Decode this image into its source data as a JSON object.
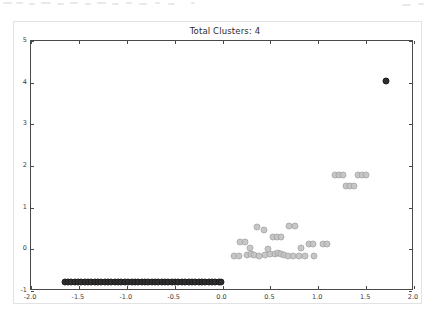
{
  "figure": {
    "title": "Total Clusters: 4",
    "background_color": "#ffffff",
    "frame_color": "#e2e2e4",
    "axes_color": "#4a4a4a"
  },
  "speckles": [
    {
      "x": 3,
      "y": 2,
      "w": 9
    },
    {
      "x": 16,
      "y": 2,
      "w": 7
    },
    {
      "x": 29,
      "y": 3,
      "w": 6
    },
    {
      "x": 41,
      "y": 2,
      "w": 10
    },
    {
      "x": 57,
      "y": 3,
      "w": 7
    },
    {
      "x": 70,
      "y": 2,
      "w": 8
    },
    {
      "x": 85,
      "y": 3,
      "w": 6
    },
    {
      "x": 97,
      "y": 2,
      "w": 9
    },
    {
      "x": 112,
      "y": 3,
      "w": 7
    },
    {
      "x": 126,
      "y": 2,
      "w": 6
    },
    {
      "x": 139,
      "y": 3,
      "w": 8
    },
    {
      "x": 155,
      "y": 2,
      "w": 5
    },
    {
      "x": 168,
      "y": 3,
      "w": 7
    },
    {
      "x": 191,
      "y": 2,
      "w": 4
    },
    {
      "x": 402,
      "y": 4,
      "w": 9
    },
    {
      "x": 418,
      "y": 3,
      "w": 6
    }
  ],
  "chart_data": {
    "type": "scatter",
    "title": "Total Clusters: 4",
    "xlabel": "",
    "ylabel": "",
    "xlim": [
      -2.0,
      2.0
    ],
    "ylim": [
      -1,
      5
    ],
    "grid": false,
    "legend": null,
    "total_clusters": 4,
    "xticks": [
      -2.0,
      -1.5,
      -1.0,
      -0.5,
      0.0,
      0.5,
      1.0,
      1.5,
      2.0
    ],
    "xticklabels": [
      "-2.0",
      "-1.5",
      "-1.0",
      "-0.5",
      "0.0",
      "0.5",
      "1.0",
      "1.5",
      "2.0"
    ],
    "yticks": [
      -1,
      0,
      1,
      2,
      3,
      4,
      5
    ],
    "yticklabels": [
      "-1",
      "0",
      "1",
      "2",
      "3",
      "4",
      "5"
    ],
    "marker_size_px": 7,
    "series": [
      {
        "name": "cluster-1",
        "color": "#2e2e2e",
        "style": "dark",
        "count": 48,
        "points": [
          [
            -1.65,
            -0.78
          ],
          [
            -1.615,
            -0.78
          ],
          [
            -1.58,
            -0.778
          ],
          [
            -1.545,
            -0.782
          ],
          [
            -1.51,
            -0.779
          ],
          [
            -1.475,
            -0.781
          ],
          [
            -1.44,
            -0.778
          ],
          [
            -1.405,
            -0.78
          ],
          [
            -1.37,
            -0.783
          ],
          [
            -1.335,
            -0.779
          ],
          [
            -1.3,
            -0.78
          ],
          [
            -1.265,
            -0.777
          ],
          [
            -1.23,
            -0.782
          ],
          [
            -1.195,
            -0.78
          ],
          [
            -1.16,
            -0.778
          ],
          [
            -1.125,
            -0.781
          ],
          [
            -1.09,
            -0.78
          ],
          [
            -1.055,
            -0.779
          ],
          [
            -1.02,
            -0.782
          ],
          [
            -0.985,
            -0.78
          ],
          [
            -0.95,
            -0.777
          ],
          [
            -0.915,
            -0.781
          ],
          [
            -0.88,
            -0.78
          ],
          [
            -0.845,
            -0.778
          ],
          [
            -0.81,
            -0.782
          ],
          [
            -0.775,
            -0.779
          ],
          [
            -0.74,
            -0.78
          ],
          [
            -0.705,
            -0.781
          ],
          [
            -0.67,
            -0.778
          ],
          [
            -0.635,
            -0.78
          ],
          [
            -0.6,
            -0.783
          ],
          [
            -0.565,
            -0.779
          ],
          [
            -0.53,
            -0.78
          ],
          [
            -0.495,
            -0.777
          ],
          [
            -0.46,
            -0.782
          ],
          [
            -0.425,
            -0.78
          ],
          [
            -0.39,
            -0.778
          ],
          [
            -0.355,
            -0.781
          ],
          [
            -0.32,
            -0.78
          ],
          [
            -0.285,
            -0.779
          ],
          [
            -0.25,
            -0.782
          ],
          [
            -0.215,
            -0.78
          ],
          [
            -0.18,
            -0.777
          ],
          [
            -0.145,
            -0.781
          ],
          [
            -0.11,
            -0.78
          ],
          [
            -0.075,
            -0.779
          ],
          [
            -0.04,
            -0.782
          ],
          [
            -0.015,
            -0.78
          ]
        ]
      },
      {
        "name": "cluster-2",
        "color": "#c3c3c3",
        "style": "gray",
        "count": 33,
        "points": [
          [
            0.12,
            -0.155
          ],
          [
            0.175,
            -0.15
          ],
          [
            0.255,
            -0.14
          ],
          [
            0.3,
            -0.12
          ],
          [
            0.33,
            -0.135
          ],
          [
            0.385,
            -0.15
          ],
          [
            0.445,
            -0.145
          ],
          [
            0.5,
            -0.12
          ],
          [
            0.545,
            -0.105
          ],
          [
            0.58,
            -0.095
          ],
          [
            0.61,
            -0.11
          ],
          [
            0.64,
            -0.13
          ],
          [
            0.68,
            -0.15
          ],
          [
            0.735,
            -0.148
          ],
          [
            0.795,
            -0.152
          ],
          [
            0.865,
            -0.15
          ],
          [
            0.955,
            -0.155
          ],
          [
            0.18,
            0.165
          ],
          [
            0.24,
            0.17
          ],
          [
            0.9,
            0.12
          ],
          [
            0.94,
            0.12
          ],
          [
            0.36,
            0.545
          ],
          [
            0.43,
            0.47
          ],
          [
            0.69,
            0.555
          ],
          [
            0.755,
            0.55
          ],
          [
            0.525,
            0.3
          ],
          [
            0.57,
            0.29
          ],
          [
            0.615,
            0.285
          ],
          [
            0.29,
            0.04
          ],
          [
            0.47,
            0.02
          ],
          [
            0.82,
            0.035
          ],
          [
            1.05,
            0.118
          ],
          [
            1.095,
            0.118
          ]
        ]
      },
      {
        "name": "cluster-3",
        "color": "#c3c3c3",
        "style": "gray",
        "count": 9,
        "points": [
          [
            1.175,
            1.795
          ],
          [
            1.215,
            1.795
          ],
          [
            1.255,
            1.795
          ],
          [
            1.42,
            1.795
          ],
          [
            1.46,
            1.795
          ],
          [
            1.5,
            1.795
          ],
          [
            1.29,
            1.52
          ],
          [
            1.33,
            1.52
          ],
          [
            1.37,
            1.52
          ]
        ]
      },
      {
        "name": "cluster-4",
        "color": "#2e2e2e",
        "style": "dark",
        "count": 1,
        "points": [
          [
            1.705,
            4.05
          ]
        ]
      }
    ]
  }
}
